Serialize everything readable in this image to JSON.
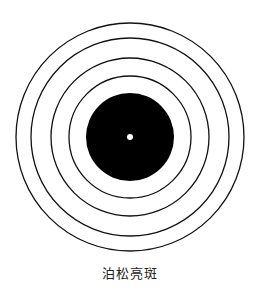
{
  "figure": {
    "caption": "泊松亮斑",
    "center": {
      "x": 130,
      "y": 137
    },
    "rings": [
      {
        "radius": 114,
        "stroke": "#111111"
      },
      {
        "radius": 99,
        "stroke": "#111111"
      },
      {
        "radius": 79,
        "stroke": "#111111"
      },
      {
        "radius": 61,
        "stroke": "#111111"
      }
    ],
    "disk": {
      "radius": 44,
      "fill": "#000000"
    },
    "bright_spot": {
      "radius": 3,
      "fill": "#ffffff"
    }
  }
}
